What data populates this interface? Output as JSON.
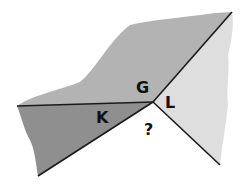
{
  "diagram": {
    "type": "geologic cross-cutting relationships",
    "labels": {
      "g": "G",
      "k": "K",
      "l": "L",
      "unknown": "?"
    },
    "colors": {
      "g_region": "#b3b3b3",
      "k_region": "#8f8f8f",
      "l_region": "#dedede",
      "unknown_region": "#ffffff",
      "lines": "#1a1a1a"
    }
  }
}
